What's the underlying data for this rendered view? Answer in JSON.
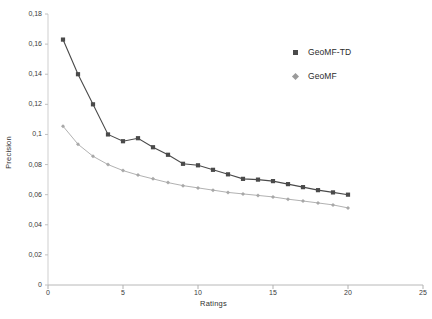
{
  "chart_data": {
    "type": "line",
    "title": "",
    "xlabel": "Ratings",
    "ylabel": "Precision",
    "xlim": [
      0,
      25
    ],
    "ylim": [
      0,
      0.18
    ],
    "xticks": [
      0,
      5,
      10,
      15,
      20,
      25
    ],
    "xtick_labels": [
      "0",
      "5",
      "10",
      "15",
      "20",
      "25"
    ],
    "yticks": [
      0,
      0.02,
      0.04,
      0.06,
      0.08,
      0.1,
      0.12,
      0.14,
      0.16,
      0.18
    ],
    "ytick_labels": [
      "0",
      "0,02",
      "0,04",
      "0,06",
      "0,08",
      "0,1",
      "0,12",
      "0,14",
      "0,16",
      "0,18"
    ],
    "grid": false,
    "legend_position": "upper right",
    "x": [
      1,
      2,
      3,
      4,
      5,
      6,
      7,
      8,
      9,
      10,
      11,
      12,
      13,
      14,
      15,
      16,
      17,
      18,
      19,
      20
    ],
    "series": [
      {
        "name": "GeoMF-TD",
        "color": "#4a4a4a",
        "marker": "square",
        "values": [
          0.163,
          0.14,
          0.12,
          0.1,
          0.0955,
          0.0975,
          0.0915,
          0.0865,
          0.0805,
          0.0795,
          0.0765,
          0.0735,
          0.0705,
          0.07,
          0.069,
          0.067,
          0.065,
          0.063,
          0.0615,
          0.06
        ]
      },
      {
        "name": "GeoMF",
        "color": "#a8a8a8",
        "marker": "diamond",
        "values": [
          0.1055,
          0.0935,
          0.0855,
          0.08,
          0.076,
          0.073,
          0.0705,
          0.068,
          0.066,
          0.0645,
          0.063,
          0.0615,
          0.0605,
          0.0595,
          0.0585,
          0.057,
          0.0558,
          0.0545,
          0.0532,
          0.0512
        ]
      }
    ]
  },
  "legend": {
    "entries": [
      {
        "label": "GeoMF-TD"
      },
      {
        "label": "GeoMF"
      }
    ]
  },
  "axes": {
    "x_title": "Ratings",
    "y_title": "Precision"
  }
}
